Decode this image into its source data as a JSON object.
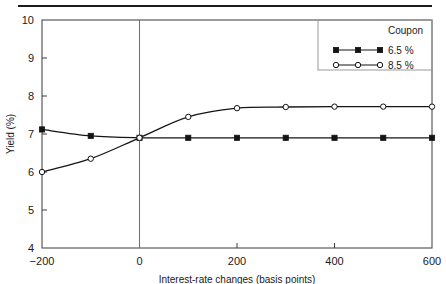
{
  "chart_data": {
    "type": "line",
    "title": "",
    "xlabel": "Interest-rate changes (basis points)",
    "ylabel": "Yield (%)",
    "x": [
      -200,
      -100,
      0,
      100,
      200,
      300,
      400,
      500,
      600
    ],
    "xlim": [
      -200,
      600
    ],
    "ylim": [
      4,
      10
    ],
    "xticks": [
      -200,
      0,
      200,
      400,
      600
    ],
    "xtick_labels": [
      "−200",
      "0",
      "200",
      "400",
      "600"
    ],
    "yticks": [
      4,
      5,
      6,
      7,
      8,
      9,
      10
    ],
    "ytick_labels": [
      "4",
      "5",
      "6",
      "7",
      "8",
      "9",
      "10"
    ],
    "grid": false,
    "annotations": [
      {
        "name": "zero-reference-line",
        "x": 0
      }
    ],
    "legend": {
      "position": "top-right",
      "title": "Coupon",
      "entries": [
        {
          "label": "6.5 %",
          "marker": "filled-square",
          "color": "#141414"
        },
        {
          "label": "8.5 %",
          "marker": "open-circle",
          "color": "#141414"
        }
      ]
    },
    "series": [
      {
        "name": "6.5 %",
        "marker": "filled-square",
        "color": "#141414",
        "values": [
          7.12,
          6.95,
          6.9,
          6.9,
          6.9,
          6.9,
          6.9,
          6.9,
          6.9
        ]
      },
      {
        "name": "8.5 %",
        "marker": "open-circle",
        "color": "#141414",
        "values": [
          6.0,
          6.35,
          6.9,
          7.45,
          7.68,
          7.71,
          7.72,
          7.72,
          7.72
        ]
      }
    ]
  }
}
